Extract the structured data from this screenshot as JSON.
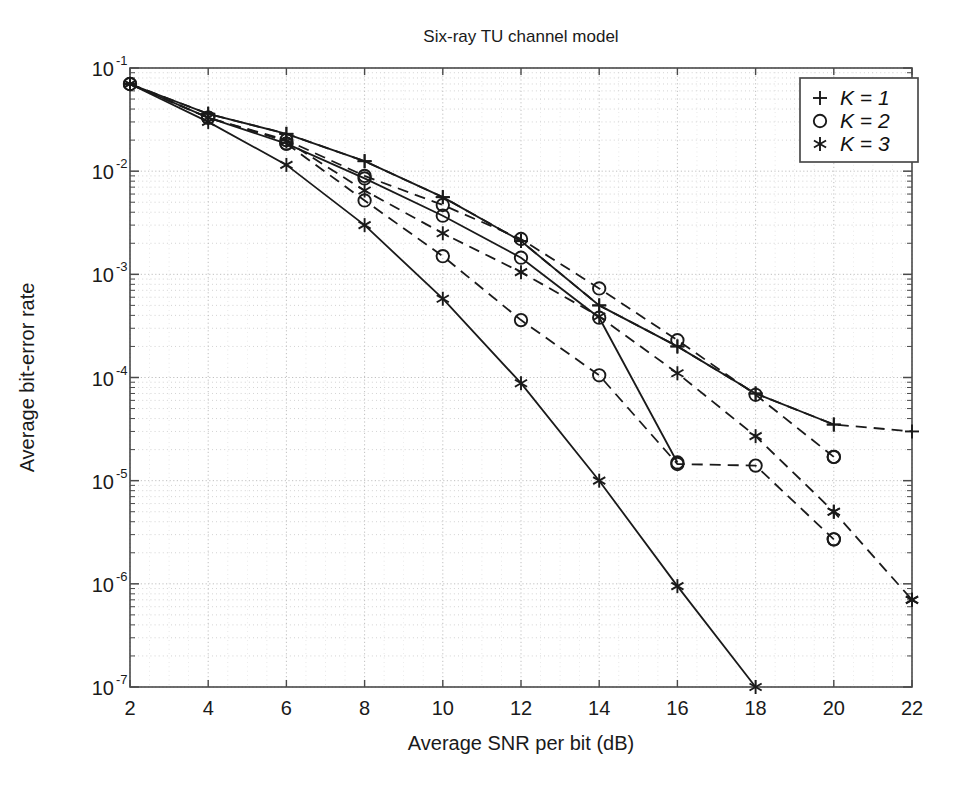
{
  "figure": {
    "title": "Six-ray TU channel model",
    "xlabel": "Average SNR per bit (dB)",
    "ylabel": "Average bit-error rate"
  },
  "axes": {
    "x_ticks": [
      "2",
      "4",
      "6",
      "8",
      "10",
      "12",
      "14",
      "16",
      "18",
      "20",
      "22"
    ],
    "y_ticks": [
      "10⁻¹",
      "10⁻²",
      "10⁻³",
      "10⁻⁴",
      "10⁻⁵",
      "10⁻⁶",
      "10⁻⁷"
    ],
    "y_tick_bases": [
      "10",
      "10",
      "10",
      "10",
      "10",
      "10",
      "10"
    ],
    "y_tick_exponents": [
      "-1",
      "-2",
      "-3",
      "-4",
      "-5",
      "-6",
      "-7"
    ],
    "xlim": [
      2,
      22
    ],
    "ylim": [
      1e-07,
      0.1
    ],
    "yscale": "log",
    "grid": true
  },
  "legend": {
    "position": "top-right",
    "entries": [
      {
        "marker": "plus-marker",
        "label": "K = 1"
      },
      {
        "marker": "circle-marker",
        "label": "K = 2"
      },
      {
        "marker": "asterisk-marker",
        "label": "K = 3"
      }
    ]
  },
  "colors": {
    "ink": "#1a1a1a",
    "grid": "#b9b9b9",
    "frame": "#4a4a4a",
    "background": "#ffffff"
  },
  "chart_data": {
    "type": "line",
    "title": "Six-ray TU channel model",
    "xlabel": "Average SNR per bit (dB)",
    "ylabel": "Average bit-error rate",
    "xlim": [
      2,
      22
    ],
    "ylim": [
      1e-07,
      0.1
    ],
    "yscale": "log",
    "grid": true,
    "legend_position": "top-right",
    "series": [
      {
        "name": "K = 1 (analysis)",
        "marker": "plus",
        "linestyle": "solid",
        "x": [
          2,
          4,
          6,
          8,
          10,
          12,
          14,
          16,
          18,
          20
        ],
        "y": [
          0.07,
          0.036,
          0.023,
          0.0125,
          0.0056,
          0.0021,
          0.0005,
          0.0002,
          7e-05,
          3.5e-05
        ]
      },
      {
        "name": "K = 2 (analysis)",
        "marker": "circle",
        "linestyle": "solid",
        "x": [
          2,
          4,
          6,
          8,
          10,
          12,
          14,
          16
        ],
        "y": [
          0.07,
          0.033,
          0.0185,
          0.0085,
          0.0037,
          0.00145,
          0.00038,
          1.5e-05
        ]
      },
      {
        "name": "K = 3 (analysis)",
        "marker": "asterisk",
        "linestyle": "solid",
        "x": [
          2,
          4,
          6,
          8,
          10,
          12,
          14,
          16,
          18
        ],
        "y": [
          0.07,
          0.03,
          0.0115,
          0.003,
          0.00058,
          8.8e-05,
          1e-05,
          9.5e-07,
          1e-07
        ]
      },
      {
        "name": "K = 1 (simulation)",
        "marker": "plus",
        "linestyle": "dashed",
        "x": [
          2,
          4,
          6,
          8,
          10,
          12,
          14,
          16,
          18,
          20,
          22
        ],
        "y": [
          0.07,
          0.036,
          0.023,
          0.0125,
          0.0056,
          0.0021,
          0.0005,
          0.0002,
          7e-05,
          3.5e-05,
          3e-05
        ]
      },
      {
        "name": "K = 2 (simulation)",
        "marker": "circle",
        "linestyle": "dashed",
        "x": [
          2,
          4,
          6,
          8,
          10,
          12,
          14,
          16,
          18,
          20
        ],
        "y": [
          0.07,
          0.033,
          0.02,
          0.009,
          0.0047,
          0.0022,
          0.00073,
          0.00023,
          6.8e-05,
          1.7e-05
        ]
      },
      {
        "name": "K = 3 (simulation)",
        "marker": "asterisk",
        "linestyle": "dashed",
        "x": [
          2,
          4,
          6,
          8,
          10,
          12,
          14,
          16,
          18,
          20,
          22
        ],
        "y": [
          0.07,
          0.033,
          0.0195,
          0.0065,
          0.0025,
          0.00105,
          0.00039,
          0.00011,
          2.7e-05,
          5e-06,
          7e-07
        ]
      },
      {
        "name": "K = 2 (lower simulation set)",
        "marker": "circle",
        "linestyle": "dashed",
        "x": [
          6,
          8,
          10,
          12,
          14,
          16,
          18,
          20
        ],
        "y": [
          0.0185,
          0.0052,
          0.0015,
          0.00036,
          0.000105,
          1.45e-05,
          1.4e-05,
          2.7e-06
        ]
      }
    ],
    "scatter_only_points": [
      {
        "marker": "circle",
        "x": 20,
        "y": 1.7e-05
      },
      {
        "marker": "circle",
        "x": 20,
        "y": 2.7e-06
      },
      {
        "marker": "asterisk",
        "x": 22,
        "y": 7e-07
      },
      {
        "marker": "asterisk",
        "x": 20,
        "y": 5e-06
      }
    ]
  }
}
